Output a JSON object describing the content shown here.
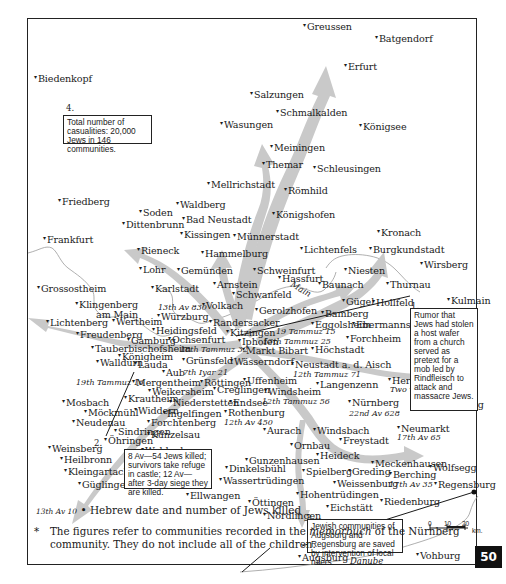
{
  "map": {
    "title_notes": {
      "note1": {
        "num": "1.",
        "text": "Rumor that Jews had stolen a host wafer from a church served as pretext for a mob led by Rindfleisch to attack and massacre Jews."
      },
      "note2": {
        "num": "2.",
        "text": "8 Av—54 Jews killed; survivors take refuge in castle; 12 Av—after 3-day siege they are killed."
      },
      "note3": {
        "num": "3.",
        "text": "Jewish communities of Augsburg and Regensburg are saved by intervention of local rulers."
      },
      "note4": {
        "num": "4.",
        "text": "Total number of casualities: 20,000 Jews in 146 communities."
      }
    },
    "towns": [
      {
        "name": "Greussen"
      },
      {
        "name": "Batgendorf"
      },
      {
        "name": "Erfurt"
      },
      {
        "name": "Biedenkopf"
      },
      {
        "name": "Salzungen"
      },
      {
        "name": "Schmalkalden"
      },
      {
        "name": "Wasungen"
      },
      {
        "name": "Königsee"
      },
      {
        "name": "Meiningen"
      },
      {
        "name": "Themar"
      },
      {
        "name": "Schleusingen"
      },
      {
        "name": "Mellrichstadt"
      },
      {
        "name": "Römhild"
      },
      {
        "name": "Friedberg"
      },
      {
        "name": "Waldberg"
      },
      {
        "name": "Soden"
      },
      {
        "name": "Bad Neustadt"
      },
      {
        "name": "Königshofen"
      },
      {
        "name": "Dittenbrunn"
      },
      {
        "name": "Kissingen"
      },
      {
        "name": "Münnerstadt"
      },
      {
        "name": "Frankfurt"
      },
      {
        "name": "Kronach"
      },
      {
        "name": "Rieneck"
      },
      {
        "name": "Hammelburg"
      },
      {
        "name": "Lichtenfels"
      },
      {
        "name": "Burgkundstadt"
      },
      {
        "name": "Lohr"
      },
      {
        "name": "Gemünden"
      },
      {
        "name": "Schweinfurt"
      },
      {
        "name": "Wirsberg"
      },
      {
        "name": "Niesten"
      },
      {
        "name": "Grossostheim"
      },
      {
        "name": "Karlstadt"
      },
      {
        "name": "Arnstein"
      },
      {
        "name": "Hassfurt"
      },
      {
        "name": "Baunach"
      },
      {
        "name": "Thurnau"
      },
      {
        "name": "Schwanfeld"
      },
      {
        "name": "Kulmain"
      },
      {
        "name": "Klingenberg am Main"
      },
      {
        "name": "Volkach"
      },
      {
        "name": "Gügel"
      },
      {
        "name": "Hollfeld"
      },
      {
        "name": "Lichtenberg"
      },
      {
        "name": "Wertheim"
      },
      {
        "name": "Würzburg"
      },
      {
        "name": "Gerolzhofen"
      },
      {
        "name": "Bamberg"
      },
      {
        "name": "Heidingsfeld"
      },
      {
        "name": "Randersacker"
      },
      {
        "name": "Freudenberg"
      },
      {
        "name": "Gamburg"
      },
      {
        "name": "Ochsenfurt"
      },
      {
        "name": "Kitzingen"
      },
      {
        "name": "Eggolsheim"
      },
      {
        "name": "Ebermannstadt"
      },
      {
        "name": "Tauberbischofsheim"
      },
      {
        "name": "Iphofen"
      },
      {
        "name": "Forchheim"
      },
      {
        "name": "Königheim"
      },
      {
        "name": "Markt Bibart"
      },
      {
        "name": "Höchstadt"
      },
      {
        "name": "Walldürn"
      },
      {
        "name": "Lauda"
      },
      {
        "name": "Grünsfeld"
      },
      {
        "name": "Wässerndorf"
      },
      {
        "name": "Aub"
      },
      {
        "name": "Neustadt a. d. Aisch"
      },
      {
        "name": "Mergentheim"
      },
      {
        "name": "Röttingen"
      },
      {
        "name": "Uffenheim"
      },
      {
        "name": "Weikersheim"
      },
      {
        "name": "Creglingen"
      },
      {
        "name": "Langenzenn"
      },
      {
        "name": "Hersbruck"
      },
      {
        "name": "Mosbach"
      },
      {
        "name": "Krautheim"
      },
      {
        "name": "Niederstetten"
      },
      {
        "name": "Endsee"
      },
      {
        "name": "Windsheim"
      },
      {
        "name": "Nürnberg"
      },
      {
        "name": "Amberg"
      },
      {
        "name": "Möckmühl"
      },
      {
        "name": "Widdern"
      },
      {
        "name": "Ingelfingen"
      },
      {
        "name": "Rothenburg"
      },
      {
        "name": "Neudenau"
      },
      {
        "name": "Forchtenberg"
      },
      {
        "name": "Sindringen"
      },
      {
        "name": "Künzelsau"
      },
      {
        "name": "Öhringen"
      },
      {
        "name": "Aurach"
      },
      {
        "name": "Windsbach"
      },
      {
        "name": "Neumarkt"
      },
      {
        "name": "Weinsberg"
      },
      {
        "name": "Waldenburg"
      },
      {
        "name": "Ornbau"
      },
      {
        "name": "Freystadt"
      },
      {
        "name": "Heilbronn"
      },
      {
        "name": "Kleingartach"
      },
      {
        "name": "Heideck"
      },
      {
        "name": "Meckenhausen"
      },
      {
        "name": "Gunzenhausen"
      },
      {
        "name": "Güglingen"
      },
      {
        "name": "Dinkelsbühl"
      },
      {
        "name": "Spielberg"
      },
      {
        "name": "Greding"
      },
      {
        "name": "Berching"
      },
      {
        "name": "Wolfsegg"
      },
      {
        "name": "Wassertrüdingen"
      },
      {
        "name": "Weissenburg"
      },
      {
        "name": "Regensburg"
      },
      {
        "name": "Ellwangen"
      },
      {
        "name": "Öttingen"
      },
      {
        "name": "Hohentrüdingen"
      },
      {
        "name": "Riedenburg"
      },
      {
        "name": "Nördlingen"
      },
      {
        "name": "Eichstätt"
      },
      {
        "name": "Augsburg"
      },
      {
        "name": "Vohburg"
      }
    ],
    "dates": {
      "wurzburg": "13th Av 830",
      "kitzingen": "19 Tammuz 15",
      "iphofen": "13th Tammuz 25",
      "ochsenfurt": "18th Tammuz 32",
      "aub": "7th Iyar 21",
      "mergentheim": "19th Tammuz 16",
      "neustadt": "12th Tammuz 71",
      "windsheim": "12th Tammuz 56",
      "rothenburg": "12th Av 450",
      "nurnberg": "22nd Av 628",
      "hersbruck": "Two women burned",
      "neumarkt": "17th Av 65",
      "berching": "17th Av 35",
      "heilbronn_arrow": "13th Av 10"
    },
    "rivers": {
      "main": "Main",
      "danube": "Danube"
    },
    "scale": {
      "ticks": [
        "0",
        "10",
        "20"
      ],
      "unit": "km."
    }
  },
  "legend": {
    "date_sample": "13th Av 10",
    "marker": "•",
    "label": "Hebrew date and number of Jews killed"
  },
  "footnote": {
    "star": "*",
    "text_before": "The figures refer to communities recorded in the ",
    "text_italic": "memorbuch",
    "text_after": " of the Nürnberg community. They do not include all of the children."
  },
  "page": {
    "number": "50"
  },
  "colors": {
    "arrow": "#c7c7c7",
    "ink": "#1a1a1a",
    "border": "#222222",
    "badge": "#111111"
  }
}
